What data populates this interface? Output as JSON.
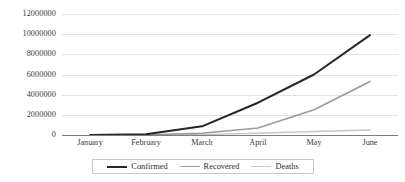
{
  "chart_data": {
    "type": "line",
    "title": "",
    "subtitle": "",
    "xlabel": "",
    "ylabel": "",
    "categories": [
      "January",
      "February",
      "March",
      "April",
      "May",
      "June"
    ],
    "ylim": [
      0,
      12000000
    ],
    "yticks": [
      0,
      2000000,
      4000000,
      6000000,
      8000000,
      10000000,
      12000000
    ],
    "ytick_labels": [
      "0",
      "2000000",
      "4000000",
      "6000000",
      "8000000",
      "10000000",
      "12000000"
    ],
    "grid": true,
    "legend_position": "bottom-center",
    "series": [
      {
        "name": "Confirmed",
        "color": "#262626",
        "width": 2.0,
        "values": [
          10000,
          85000,
          860000,
          3200000,
          6000000,
          9900000
        ]
      },
      {
        "name": "Recovered",
        "color": "#9a9a9a",
        "width": 1.6,
        "values": [
          2000,
          30000,
          180000,
          700000,
          2500000,
          5300000
        ]
      },
      {
        "name": "Deaths",
        "color": "#c6c6c6",
        "width": 1.4,
        "values": [
          200,
          3000,
          40000,
          180000,
          350000,
          500000
        ]
      }
    ]
  },
  "axes": {
    "y": {
      "ticks": [
        {
          "label": "12000000",
          "value": 12000000
        },
        {
          "label": "10000000",
          "value": 10000000
        },
        {
          "label": "8000000",
          "value": 8000000
        },
        {
          "label": "6000000",
          "value": 6000000
        },
        {
          "label": "4000000",
          "value": 4000000
        },
        {
          "label": "2000000",
          "value": 2000000
        },
        {
          "label": "0",
          "value": 0
        }
      ]
    },
    "x": {
      "ticks": [
        {
          "label": "January"
        },
        {
          "label": "February"
        },
        {
          "label": "March"
        },
        {
          "label": "April"
        },
        {
          "label": "May"
        },
        {
          "label": "June"
        }
      ]
    }
  },
  "legend": {
    "entries": [
      {
        "label": "Confirmed",
        "color": "#262626",
        "width": 2.0
      },
      {
        "label": "Recovered",
        "color": "#9a9a9a",
        "width": 1.6
      },
      {
        "label": "Deaths",
        "color": "#c6c6c6",
        "width": 1.4
      }
    ]
  },
  "colors": {
    "gridline": "#e3e3e3",
    "axis": "#7d7d7d",
    "text": "#3a3a3a",
    "background": "#ffffff",
    "legend_border": "#c8c8c8"
  }
}
